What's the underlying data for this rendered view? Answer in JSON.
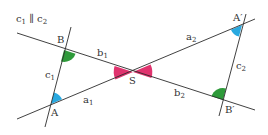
{
  "diagram": {
    "caption": {
      "base": "c",
      "sub1": "1",
      "sep": " ∥ ",
      "base2": "c",
      "sub2": "2"
    },
    "points": {
      "A": {
        "label": "A",
        "x": 51,
        "y": 104
      },
      "B": {
        "label": "B",
        "x": 64,
        "y": 50
      },
      "S": {
        "label": "S",
        "x": 133,
        "y": 72
      },
      "A_prime": {
        "label": "A′",
        "x": 242,
        "y": 25
      },
      "B_prime": {
        "label": "B′",
        "x": 223,
        "y": 100
      }
    },
    "segments": {
      "a1": {
        "base": "a",
        "sub": "1"
      },
      "a2": {
        "base": "a",
        "sub": "2"
      },
      "b1": {
        "base": "b",
        "sub": "1"
      },
      "b2": {
        "base": "b",
        "sub": "2"
      },
      "c1": {
        "base": "c",
        "sub": "1"
      },
      "c2": {
        "base": "c",
        "sub": "2"
      }
    },
    "colors": {
      "line": "#2b2b2b",
      "angle_A": "#29a9e0",
      "angle_B": "#2e9a3a",
      "angle_S": "#e0336e",
      "text": "#333333"
    }
  }
}
